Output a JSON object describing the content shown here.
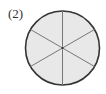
{
  "label": "(2)",
  "figure": {
    "shape": "circle",
    "divisions": 6,
    "fill": "#e8e8e8",
    "stroke": "#333333",
    "divider_color": "#777777"
  }
}
